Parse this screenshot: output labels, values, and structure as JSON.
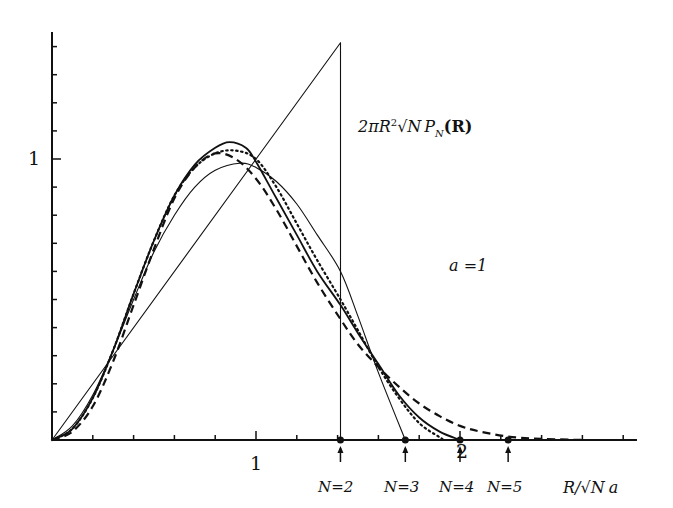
{
  "chart_data": {
    "type": "line",
    "title": "",
    "ylabel": "2πR²√N P_N(R)",
    "xlabel": "R/√N a",
    "annotation": "a = 1",
    "xlim": [
      0,
      2.85
    ],
    "ylim": [
      0,
      1.45
    ],
    "grid": false,
    "x_ticks": {
      "step": 0.2,
      "labels": [
        {
          "value": 1,
          "text": "1"
        },
        {
          "value": 2,
          "text": "2"
        }
      ]
    },
    "y_ticks": {
      "step": 0.1,
      "labels": [
        {
          "value": 1,
          "text": "1"
        }
      ]
    },
    "cutoff_markers": [
      {
        "label": "N=2",
        "x": 1.414
      },
      {
        "label": "N=3",
        "x": 1.732
      },
      {
        "label": "N=4",
        "x": 2.0
      },
      {
        "label": "N=5",
        "x": 2.236
      }
    ],
    "series": [
      {
        "name": "N=2",
        "style": "thin-solid",
        "x": [
          0,
          1.414,
          1.414
        ],
        "y": [
          0,
          1.414,
          0
        ]
      },
      {
        "name": "N=3",
        "style": "thin-solid",
        "x": [
          0,
          0.1,
          0.2,
          0.3,
          0.4,
          0.5,
          0.6,
          0.7,
          0.8,
          0.92,
          1.0,
          1.1,
          1.2,
          1.3,
          1.414,
          1.5,
          1.6,
          1.732
        ],
        "y": [
          0,
          0.05,
          0.16,
          0.32,
          0.5,
          0.67,
          0.8,
          0.9,
          0.96,
          0.985,
          0.97,
          0.92,
          0.84,
          0.73,
          0.6,
          0.44,
          0.24,
          0
        ]
      },
      {
        "name": "N=4",
        "style": "thick-solid",
        "x": [
          0,
          0.1,
          0.2,
          0.3,
          0.4,
          0.5,
          0.6,
          0.7,
          0.8,
          0.87,
          0.95,
          1.0,
          1.1,
          1.2,
          1.3,
          1.414,
          1.5,
          1.6,
          1.7,
          1.8,
          1.9,
          2.0
        ],
        "y": [
          0,
          0.04,
          0.15,
          0.32,
          0.52,
          0.71,
          0.87,
          0.98,
          1.04,
          1.06,
          1.04,
          0.99,
          0.86,
          0.73,
          0.6,
          0.48,
          0.38,
          0.27,
          0.16,
          0.08,
          0.03,
          0
        ]
      },
      {
        "name": "dotted",
        "style": "dotted",
        "x": [
          0,
          0.1,
          0.2,
          0.3,
          0.4,
          0.5,
          0.6,
          0.7,
          0.8,
          0.9,
          1.0,
          1.1,
          1.2,
          1.3,
          1.414,
          1.5,
          1.6,
          1.7,
          1.8,
          1.9,
          1.92
        ],
        "y": [
          0,
          0.04,
          0.15,
          0.32,
          0.52,
          0.71,
          0.87,
          0.97,
          1.02,
          1.03,
          1.0,
          0.9,
          0.77,
          0.64,
          0.5,
          0.39,
          0.26,
          0.15,
          0.06,
          0.01,
          0
        ]
      },
      {
        "name": "dashed",
        "style": "dashed",
        "x": [
          0,
          0.1,
          0.2,
          0.3,
          0.4,
          0.5,
          0.6,
          0.7,
          0.8,
          0.9,
          1.0,
          1.1,
          1.2,
          1.3,
          1.414,
          1.5,
          1.6,
          1.7,
          1.8,
          1.9,
          2.0,
          2.1,
          2.236,
          2.4,
          2.6
        ],
        "y": [
          0,
          0.03,
          0.12,
          0.28,
          0.48,
          0.68,
          0.86,
          0.97,
          1.02,
          1.0,
          0.93,
          0.82,
          0.69,
          0.56,
          0.43,
          0.34,
          0.26,
          0.19,
          0.13,
          0.085,
          0.05,
          0.03,
          0.012,
          0.004,
          0
        ]
      }
    ]
  },
  "labels": {
    "x_tick_1": "1",
    "x_tick_2": "2",
    "y_tick_1": "1",
    "y_axis_prefix": "2πR",
    "y_axis_sup": "2",
    "y_axis_root": "√N",
    "y_axis_p": "P",
    "y_axis_sub": "N",
    "y_axis_arg": "(R)",
    "annotation": "a =1",
    "x_axis_num": "R/",
    "x_axis_root": "√N",
    "x_axis_a": "a",
    "markers": [
      "N=2",
      "N=3",
      "N=4",
      "N=5"
    ]
  }
}
